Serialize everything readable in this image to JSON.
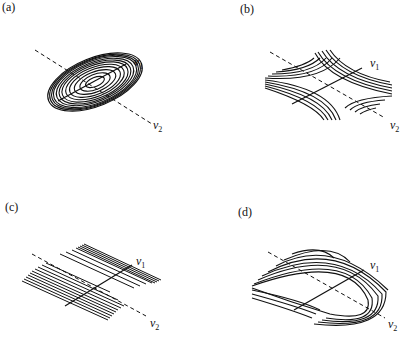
{
  "figure": {
    "panels": [
      {
        "id": "a",
        "label": "(a)",
        "shape": "elliptic-contours",
        "axis1": "v",
        "axis1_sub": "1",
        "axis2": "v",
        "axis2_sub": "2"
      },
      {
        "id": "b",
        "label": "(b)",
        "shape": "hyperbolic-saddle-contours",
        "axis1": "v",
        "axis1_sub": "1",
        "axis2": "v",
        "axis2_sub": "2"
      },
      {
        "id": "c",
        "label": "(c)",
        "shape": "parallel-line-contours",
        "axis1": "v",
        "axis1_sub": "1",
        "axis2": "v",
        "axis2_sub": "2"
      },
      {
        "id": "d",
        "label": "(d)",
        "shape": "parabolic-contours",
        "axis1": "v",
        "axis1_sub": "1",
        "axis2": "v",
        "axis2_sub": "2"
      }
    ],
    "colors": {
      "ink": "#111111",
      "background": "#ffffff"
    }
  }
}
